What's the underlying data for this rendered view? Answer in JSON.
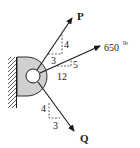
{
  "diagram": {
    "type": "free-body / statics force diagram",
    "support": "wall-mounted bracket with pin hole",
    "forces": [
      {
        "name": "P",
        "label": "P",
        "magnitude_label": "",
        "slope": {
          "rise_label": "4",
          "run_label": "3"
        },
        "direction": "up-right"
      },
      {
        "name": "650 lb",
        "label": "650",
        "unit": "lb",
        "slope": {
          "rise_label": "5",
          "run_label": "12"
        },
        "direction": "up-right"
      },
      {
        "name": "Q",
        "label": "Q",
        "magnitude_label": "",
        "slope": {
          "rise_label": "4",
          "run_label": "3"
        },
        "direction": "down-right"
      }
    ]
  },
  "colors": {
    "line": "#1a1a1a",
    "bracket_fill": "#d0d0d0",
    "background": "#ffffff"
  }
}
